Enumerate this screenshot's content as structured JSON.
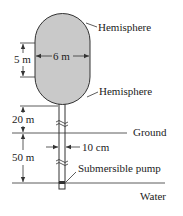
{
  "labels": {
    "hemisphere_top": "Hemisphere",
    "hemisphere_bottom": "Hemisphere",
    "cylinder_height": "5 m",
    "tank_diameter": "6 m",
    "height_above_ground": "20 m",
    "ground": "Ground",
    "depth_below_ground": "50 m",
    "pipe_diameter": "10 cm",
    "pump": "Submersible pump",
    "water": "Water"
  },
  "colors": {
    "tank_fill": "#c9c9c9",
    "line": "#333333"
  }
}
